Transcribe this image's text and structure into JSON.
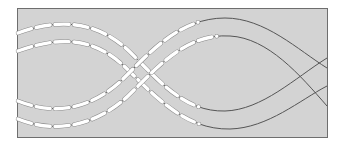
{
  "figure": {
    "panel": {
      "fill": "#d3d3d3",
      "border": "#6e6e6e",
      "x": 17,
      "y": 8,
      "width": 310,
      "height": 129
    },
    "colors": {
      "line": "#555555",
      "stitch": "#ffffff",
      "stitch_outline": "#8a8a8a"
    },
    "strands": [
      {
        "id": "strand-1",
        "path": "M18,33 C70,14 105,28 130,52 C160,82 185,112 225,111 C262,110 295,78 327,58"
      },
      {
        "id": "strand-2",
        "path": "M18,51 C70,32 100,44 124,66 C155,96 185,130 230,129 C268,128 300,100 327,86"
      },
      {
        "id": "strand-3",
        "path": "M18,101 C60,118 95,105 122,80 C150,52 180,18 225,18 C265,18 298,50 327,68"
      },
      {
        "id": "strand-4",
        "path": "M18,119 C60,136 100,122 128,96 C155,70 185,33 230,36 C268,38 300,75 327,106"
      }
    ],
    "stitch_dash": "14 5",
    "stitch_extent": 0.62
  }
}
